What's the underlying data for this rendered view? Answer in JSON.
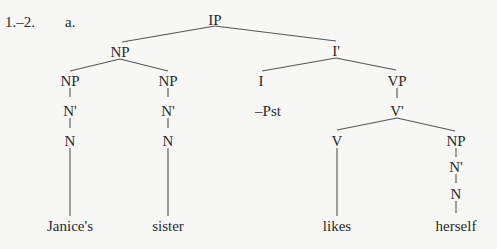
{
  "example": {
    "number": "1.–2.",
    "letter": "a."
  },
  "tree": {
    "root": "IP",
    "nodes": {
      "ip": "IP",
      "np_subj": "NP",
      "np_poss": "NP",
      "nbar_poss": "N'",
      "n_poss": "N",
      "np_head": "NP",
      "nbar_head": "N'",
      "n_head": "N",
      "ibar": "I'",
      "i": "I",
      "tense": "–Pst",
      "vp": "VP",
      "vbar": "V'",
      "v": "V",
      "np_obj": "NP",
      "nbar_obj": "N'",
      "n_obj": "N"
    },
    "words": {
      "janices": "Janice's",
      "sister": "sister",
      "likes": "likes",
      "herself": "herself"
    }
  }
}
